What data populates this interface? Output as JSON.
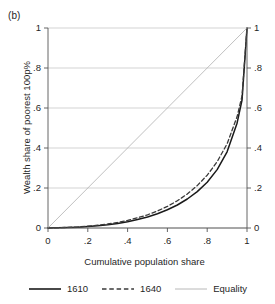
{
  "figure": {
    "panel_label": "(b)",
    "xlabel": "Cumulative population share",
    "ylabel": "Wealth share of poorest 100p%"
  },
  "legend": {
    "items": [
      {
        "label": "1610",
        "style": "solid",
        "color": "#1a1a1a"
      },
      {
        "label": "1640",
        "style": "dashed",
        "color": "#3a3a3a"
      },
      {
        "label": "Equality",
        "style": "solid-thin",
        "color": "#b0b0b0"
      }
    ]
  },
  "axes": {
    "x_ticks": [
      "0",
      ".2",
      ".4",
      ".6",
      ".8",
      "1"
    ],
    "y_ticks_left": [
      "0",
      ".2",
      ".4",
      ".6",
      ".8",
      "1"
    ],
    "y_ticks_right": [
      "0",
      ".2",
      ".4",
      ".6",
      ".8",
      "1"
    ]
  },
  "chart_data": {
    "type": "line",
    "title": "(b)",
    "xlabel": "Cumulative population share",
    "ylabel": "Wealth share of poorest 100p%",
    "xlim": [
      0,
      1
    ],
    "ylim": [
      0,
      1
    ],
    "xticks": [
      0,
      0.2,
      0.4,
      0.6,
      0.8,
      1
    ],
    "yticks": [
      0,
      0.2,
      0.4,
      0.6,
      0.8,
      1
    ],
    "grid": "horizontal",
    "legend_position": "below",
    "x": [
      0,
      0.05,
      0.1,
      0.15,
      0.2,
      0.25,
      0.3,
      0.35,
      0.4,
      0.45,
      0.5,
      0.55,
      0.6,
      0.65,
      0.7,
      0.75,
      0.8,
      0.85,
      0.9,
      0.95,
      0.975,
      1
    ],
    "series": [
      {
        "name": "1610",
        "style": "solid",
        "color": "#1a1a1a",
        "values": [
          0,
          0.001,
          0.002,
          0.004,
          0.007,
          0.011,
          0.016,
          0.023,
          0.031,
          0.042,
          0.055,
          0.071,
          0.091,
          0.115,
          0.145,
          0.182,
          0.229,
          0.292,
          0.381,
          0.524,
          0.64,
          1.0
        ]
      },
      {
        "name": "1640",
        "style": "dashed",
        "color": "#3a3a3a",
        "values": [
          0,
          0.001,
          0.003,
          0.005,
          0.009,
          0.014,
          0.02,
          0.028,
          0.038,
          0.051,
          0.066,
          0.085,
          0.108,
          0.136,
          0.17,
          0.212,
          0.264,
          0.331,
          0.421,
          0.556,
          0.66,
          1.0
        ]
      },
      {
        "name": "Equality",
        "style": "solid-thin",
        "color": "#b0b0b0",
        "values": [
          0,
          0.05,
          0.1,
          0.15,
          0.2,
          0.25,
          0.3,
          0.35,
          0.4,
          0.45,
          0.5,
          0.55,
          0.6,
          0.65,
          0.7,
          0.75,
          0.8,
          0.85,
          0.9,
          0.95,
          0.975,
          1.0
        ]
      }
    ]
  }
}
